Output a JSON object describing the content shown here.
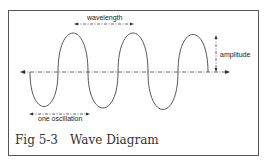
{
  "figure": {
    "number": "Fig 5-3",
    "title": "Wave Diagram"
  },
  "labels": {
    "wavelength": "wavelength",
    "amplitude": "amplitude",
    "one_oscillation": "one oscillation"
  },
  "colors": {
    "line": "#444444",
    "frame": "#555555",
    "text": "#333333"
  }
}
